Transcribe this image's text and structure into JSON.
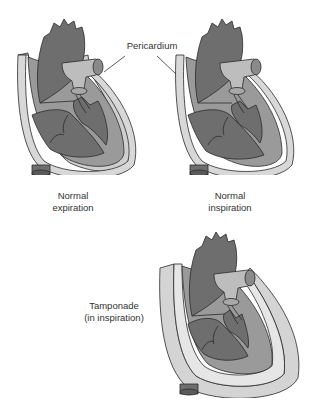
{
  "diagram": {
    "callout_label": "Pericardium",
    "panels": [
      {
        "id": "normal-expiration",
        "caption_line1": "Normal",
        "caption_line2": "expiration"
      },
      {
        "id": "normal-inspiration",
        "caption_line1": "Normal",
        "caption_line2": "inspiration"
      },
      {
        "id": "tamponade",
        "caption_line1": "Tamponade",
        "caption_line2": "(in inspiration)"
      }
    ],
    "colors": {
      "chamber": "#6e6e6e",
      "myocardium": "#9a9a9a",
      "pericardium": "#cfcfcf",
      "valve": "#bdbdbd",
      "outline": "#2a2a2a"
    }
  }
}
